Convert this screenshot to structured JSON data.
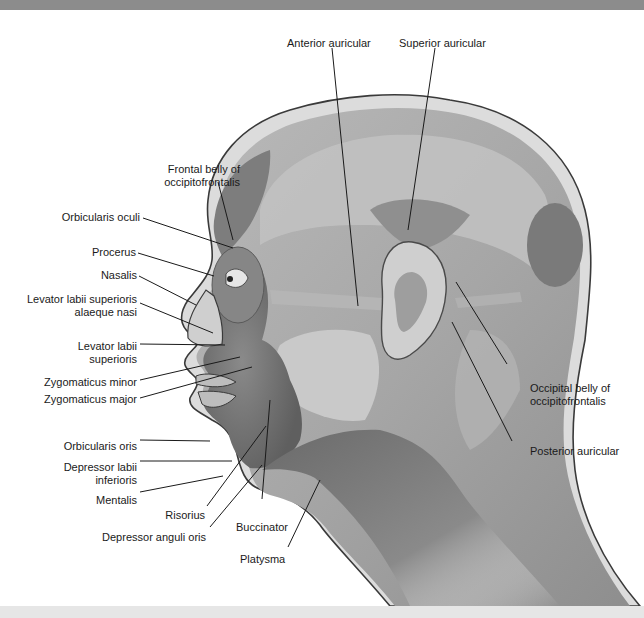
{
  "figure": {
    "labels_left": [
      {
        "id": "frontal-belly",
        "text": "Frontal belly of\noccipitofrontalis",
        "line1": "Frontal belly of",
        "line2": "occipitofrontalis"
      },
      {
        "id": "orbicularis-oculi",
        "text": "Orbicularis oculi"
      },
      {
        "id": "procerus",
        "text": "Procerus"
      },
      {
        "id": "nasalis",
        "text": "Nasalis"
      },
      {
        "id": "levator-labii-sup-alaeque",
        "line1": "Levator labii superioris",
        "line2": "alaeque nasi"
      },
      {
        "id": "levator-labii-sup",
        "line1": "Levator labii",
        "line2": "superioris"
      },
      {
        "id": "zygomaticus-minor",
        "text": "Zygomaticus minor"
      },
      {
        "id": "zygomaticus-major",
        "text": "Zygomaticus major"
      },
      {
        "id": "orbicularis-oris",
        "text": "Orbicularis oris"
      },
      {
        "id": "depressor-labii-inf",
        "line1": "Depressor labii",
        "line2": "inferioris"
      },
      {
        "id": "mentalis",
        "text": "Mentalis"
      },
      {
        "id": "risorius",
        "text": "Risorius"
      },
      {
        "id": "depressor-anguli-oris",
        "text": "Depressor anguli oris"
      },
      {
        "id": "buccinator",
        "text": "Buccinator"
      },
      {
        "id": "platysma",
        "text": "Platysma"
      }
    ],
    "labels_top": [
      {
        "id": "anterior-auricular",
        "text": "Anterior auricular"
      },
      {
        "id": "superior-auricular",
        "text": "Superior auricular"
      }
    ],
    "labels_right": [
      {
        "id": "occipital-belly",
        "line1": "Occipital belly of",
        "line2": "occipitofrontalis"
      },
      {
        "id": "posterior-auricular",
        "text": "Posterior auricular"
      }
    ]
  },
  "colors": {
    "top_bar": "#8c8c8c",
    "bottom_bar": "#e6e6e6",
    "skin_outline": "#3a3a3a",
    "muscle_dark": "#6e6e6e",
    "muscle_mid": "#9a9a9a",
    "muscle_light": "#c4c4c4",
    "skin": "#d9d9d9"
  }
}
